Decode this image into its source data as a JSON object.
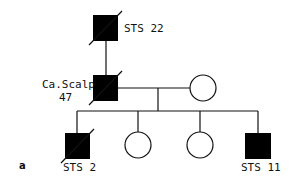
{
  "figure": {
    "panel_label": "a",
    "colors": {
      "affected": "#000000",
      "line": "#111111",
      "background": "#ffffff"
    }
  },
  "pedigree": {
    "generation_1": {
      "individual": {
        "sex": "male",
        "affected": true,
        "deceased": true,
        "label": "STS 22"
      }
    },
    "generation_2": {
      "proband_father": {
        "sex": "male",
        "affected": true,
        "deceased": true,
        "label_line1": "Ca.Scalp",
        "label_line2": "47"
      },
      "spouse": {
        "sex": "female",
        "affected": false,
        "deceased": false
      }
    },
    "generation_3": {
      "children": [
        {
          "sex": "male",
          "affected": true,
          "deceased": true,
          "label": "STS 2"
        },
        {
          "sex": "female",
          "affected": false,
          "deceased": false,
          "label": ""
        },
        {
          "sex": "female",
          "affected": false,
          "deceased": false,
          "label": ""
        },
        {
          "sex": "male",
          "affected": true,
          "deceased": false,
          "label": "STS 11"
        }
      ]
    }
  }
}
